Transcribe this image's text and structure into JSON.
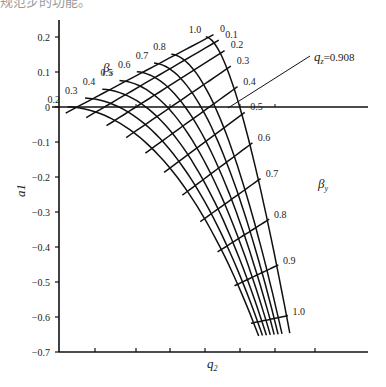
{
  "header_fragment": "规范步的功能。",
  "chart_data": {
    "type": "line",
    "title": "",
    "xlabel": "q2",
    "ylabel": "a1",
    "ylim": [
      -0.7,
      0.22
    ],
    "yticks": [
      0.2,
      0.1,
      0,
      -0.1,
      -0.2,
      -0.3,
      -0.4,
      -0.5,
      -0.6,
      -0.7
    ],
    "ytick_labels": [
      "0.2",
      "0.1",
      "0",
      "−0.1",
      "−0.2",
      "−0.3",
      "−0.4",
      "−0.5",
      "−0.6",
      "−0.7"
    ],
    "xtick_count": 7,
    "xtick_labels_shown": false,
    "grid": false,
    "annotation": {
      "text_var": "q",
      "text_sub": "z",
      "text_value": "=0.908"
    },
    "families": [
      {
        "name": "beta_x",
        "label_var": "β",
        "label_sub": "x",
        "description": "steep downward-curving lines, labels at top-left",
        "values": [
          0.2,
          0.3,
          0.4,
          0.5,
          0.6,
          0.7,
          0.8,
          1.0
        ]
      },
      {
        "name": "beta_y",
        "label_var": "β",
        "label_sub": "y",
        "description": "slanted lines rising to the right, labels at right ends",
        "values": [
          0,
          0.1,
          0.2,
          0.3,
          0.4,
          0.5,
          0.6,
          0.7,
          0.8,
          0.9,
          1.0
        ]
      }
    ]
  },
  "labels": {
    "beta_x": [
      "0.2",
      "0.3",
      "0.4",
      "0.5",
      "0.6",
      "0.7",
      "0.8",
      "1.0"
    ],
    "beta_y": [
      "0",
      "0.1",
      "0.2",
      "0.3",
      "0.4",
      "0.5",
      "0.6",
      "0.7",
      "0.8",
      "0.9",
      "1.0"
    ]
  }
}
